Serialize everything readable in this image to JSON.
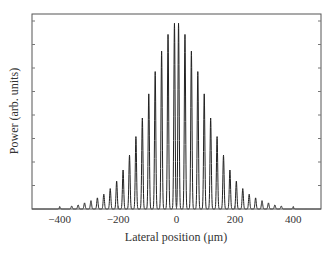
{
  "chart_data": {
    "type": "line",
    "title": "",
    "xlabel": "Lateral position (μm)",
    "ylabel": "Power (arb. units)",
    "xlim": [
      -495,
      495
    ],
    "ylim": [
      0,
      1.05
    ],
    "xticks": [
      -400,
      -200,
      0,
      200,
      400
    ],
    "xtick_labels": [
      "−400",
      "−200",
      "0",
      "200",
      "400"
    ],
    "yticks_count": 8,
    "ytick_labels_shown": false,
    "grid": false,
    "legend": null,
    "frame": "box",
    "line_color": "#222222",
    "series": [
      {
        "name": "Power",
        "peak_positions": [
          -400,
          -359,
          -337,
          -315,
          -293,
          -271,
          -249,
          -227,
          -205,
          -183,
          -161,
          -139,
          -117,
          -95,
          -73,
          -51,
          -29,
          -7,
          7,
          29,
          51,
          73,
          95,
          117,
          139,
          161,
          183,
          205,
          227,
          249,
          271,
          293,
          315,
          337,
          359,
          400
        ],
        "peak_heights": [
          0.01,
          0.016,
          0.022,
          0.033,
          0.045,
          0.06,
          0.08,
          0.11,
          0.15,
          0.21,
          0.29,
          0.39,
          0.49,
          0.62,
          0.74,
          0.85,
          0.94,
          1.0,
          1.0,
          0.94,
          0.85,
          0.74,
          0.62,
          0.49,
          0.39,
          0.29,
          0.21,
          0.15,
          0.11,
          0.08,
          0.06,
          0.045,
          0.033,
          0.022,
          0.016,
          0.01
        ],
        "peak_width_um": 5
      }
    ]
  }
}
